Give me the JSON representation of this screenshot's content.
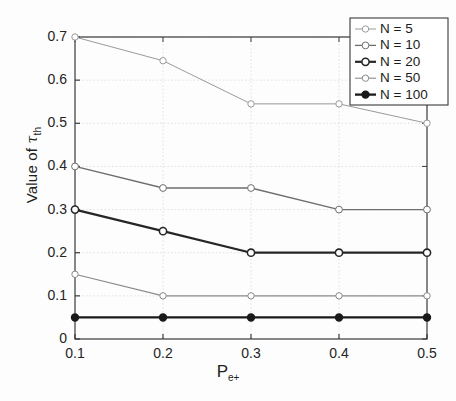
{
  "chart_data": {
    "type": "line",
    "title": "",
    "subtitle": "",
    "xlabel": "P",
    "xlabel_sub": "e+",
    "ylabel": "Value of",
    "ylabel_symbol": "τ",
    "ylabel_sub": "th",
    "x": [
      0.1,
      0.2,
      0.3,
      0.4,
      0.5
    ],
    "xlim": [
      0.1,
      0.5
    ],
    "ylim": [
      0,
      0.7
    ],
    "xticks": [
      "0.1",
      "0.2",
      "0.3",
      "0.4",
      "0.5"
    ],
    "yticks": [
      "0",
      "0.1",
      "0.2",
      "0.3",
      "0.4",
      "0.5",
      "0.6",
      "0.7"
    ],
    "ytick_values": [
      0,
      0.1,
      0.2,
      0.3,
      0.4,
      0.5,
      0.6,
      0.7
    ],
    "xtick_values": [
      0.1,
      0.2,
      0.3,
      0.4,
      0.5
    ],
    "grid": true,
    "grid_color": "#d8d8d8",
    "axis_color": "#3a3a3a",
    "legend_position": "upper right",
    "series": [
      {
        "name": "N = 5",
        "values": [
          0.7,
          0.645,
          0.545,
          0.545,
          0.5
        ],
        "color": "#9a9a9a",
        "width": 1.0,
        "marker": "open-circle",
        "marker_size": 3.2
      },
      {
        "name": "N = 10",
        "values": [
          0.4,
          0.35,
          0.35,
          0.3,
          0.3
        ],
        "color": "#6e6e6e",
        "width": 1.3,
        "marker": "open-circle",
        "marker_size": 3.4
      },
      {
        "name": "N = 20",
        "values": [
          0.3,
          0.25,
          0.2,
          0.2,
          0.2
        ],
        "color": "#262626",
        "width": 2.2,
        "marker": "open-circle",
        "marker_size": 3.6
      },
      {
        "name": "N = 50",
        "values": [
          0.15,
          0.1,
          0.1,
          0.1,
          0.1
        ],
        "color": "#8a8a8a",
        "width": 1.1,
        "marker": "open-circle",
        "marker_size": 3.2
      },
      {
        "name": "N = 100",
        "values": [
          0.05,
          0.05,
          0.05,
          0.05,
          0.05
        ],
        "color": "#1a1a1a",
        "width": 2.3,
        "marker": "filled-circle",
        "marker_size": 3.4
      }
    ]
  },
  "legend": {
    "entries": [
      "N = 5",
      "N = 10",
      "N = 20",
      "N = 50",
      "N = 100"
    ],
    "border_color": "#3a3a3a",
    "background": "#ffffff"
  }
}
